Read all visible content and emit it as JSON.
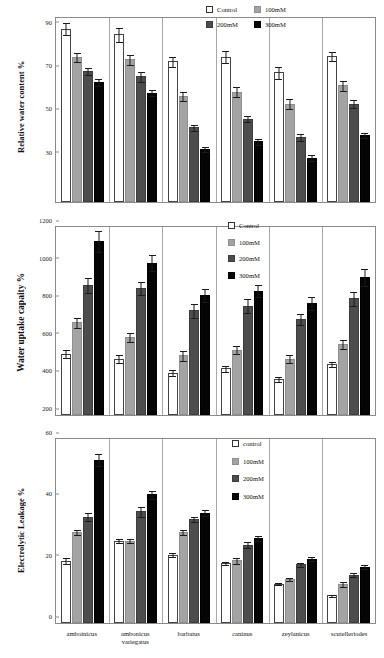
{
  "figure": {
    "categories": [
      "amboinicus",
      "ambonicus variegatus",
      "barbatus",
      "caninus",
      "zeylanicus",
      "scutelleriodes"
    ],
    "series_colors": {
      "control": "#ffffff",
      "100mM": "#a3a3a3",
      "200mM": "#4d4d4d",
      "300mM": "#050505"
    }
  },
  "chart_data": [
    {
      "type": "bar",
      "id": "relative-water-content",
      "title": "",
      "ylabel": "Relative water content  %",
      "xlabel": "",
      "ylim": [
        10,
        95
      ],
      "yticks": [
        30,
        50,
        70,
        90
      ],
      "ytick_labels": [
        "30",
        "50",
        "70",
        "90"
      ],
      "grid": false,
      "legend_position": "top-right",
      "legend": [
        "Control",
        "100mM",
        "200mM",
        "300mM"
      ],
      "categories": [
        "amboinicus",
        "ambonicus variegatus",
        "barbatus",
        "caninus",
        "zeylanicus",
        "scutelleriodes"
      ],
      "series": [
        {
          "name": "Control",
          "values": [
            90.0,
            87.5,
            75.0,
            77.0,
            70.0,
            77.5
          ],
          "errors": [
            3.0,
            3.5,
            2.5,
            3.0,
            3.0,
            2.5
          ]
        },
        {
          "name": "100mM",
          "values": [
            77.0,
            76.0,
            59.0,
            61.0,
            55.5,
            64.0
          ],
          "errors": [
            2.5,
            2.5,
            2.5,
            2.5,
            2.5,
            2.5
          ]
        },
        {
          "name": "200mM",
          "values": [
            70.5,
            68.0,
            44.5,
            48.5,
            40.0,
            55.5
          ],
          "errors": [
            2.0,
            2.5,
            1.5,
            1.5,
            2.0,
            2.0
          ]
        },
        {
          "name": "300mM",
          "values": [
            65.5,
            60.5,
            34.5,
            38.0,
            30.5,
            41.0
          ],
          "errors": [
            2.0,
            1.5,
            1.5,
            1.5,
            1.5,
            1.5
          ]
        }
      ]
    },
    {
      "type": "bar",
      "id": "water-uptake-capacity",
      "title": "",
      "ylabel": "Water uptake capaity %",
      "xlabel": "",
      "ylim": [
        200,
        1200
      ],
      "yticks": [
        200,
        400,
        600,
        800,
        1000,
        1200
      ],
      "ytick_labels": [
        "200",
        "400",
        "600",
        "800",
        "1000",
        "1200"
      ],
      "grid": false,
      "legend_position": "top-right",
      "legend": [
        "Control",
        "100mM",
        "200mM",
        "300mM"
      ],
      "categories": [
        "amboinicus",
        "ambonicus variegatus",
        "barbatus",
        "caninus",
        "zeylanicus",
        "scutelleriodes"
      ],
      "series": [
        {
          "name": "Control",
          "values": [
            527,
            500,
            425,
            448,
            392,
            472
          ],
          "errors": [
            22,
            22,
            20,
            18,
            18,
            18
          ]
        },
        {
          "name": "100mM",
          "values": [
            693,
            615,
            517,
            547,
            500,
            578
          ],
          "errors": [
            30,
            28,
            28,
            25,
            25,
            28
          ]
        },
        {
          "name": "200mM",
          "values": [
            890,
            876,
            757,
            782,
            712,
            820
          ],
          "errors": [
            42,
            35,
            40,
            38,
            32,
            42
          ]
        },
        {
          "name": "300mM",
          "values": [
            1125,
            1010,
            838,
            862,
            795,
            935
          ],
          "errors": [
            58,
            45,
            38,
            35,
            38,
            48
          ]
        }
      ]
    },
    {
      "type": "bar",
      "id": "electrolytic-leakage",
      "title": "",
      "ylabel": "Electrolytic Leakage %",
      "xlabel": "",
      "ylim": [
        0,
        60
      ],
      "yticks": [
        0,
        20,
        40,
        60
      ],
      "ytick_labels": [
        "0",
        "20",
        "40",
        "60"
      ],
      "grid": false,
      "legend_position": "top-right",
      "legend": [
        "control",
        "100mM",
        "200mM",
        "300mM"
      ],
      "categories": [
        "amboinicus",
        "ambonicus variegatus",
        "barbatus",
        "caninus",
        "zeylanicus",
        "scutelleriodes"
      ],
      "series": [
        {
          "name": "control",
          "values": [
            20.3,
            26.8,
            22.2,
            19.6,
            12.8,
            9.0
          ],
          "errors": [
            1.2,
            0.8,
            0.8,
            0.7,
            0.5,
            0.4
          ]
        },
        {
          "name": "100mM",
          "values": [
            29.8,
            26.9,
            29.6,
            20.4,
            14.4,
            12.8
          ],
          "errors": [
            1.0,
            0.8,
            1.0,
            1.2,
            0.7,
            1.0
          ]
        },
        {
          "name": "200mM",
          "values": [
            34.7,
            36.4,
            33.8,
            25.6,
            19.2,
            15.7
          ],
          "errors": [
            1.5,
            1.8,
            1.0,
            1.0,
            0.8,
            0.8
          ]
        },
        {
          "name": "300mM",
          "values": [
            53.3,
            42.0,
            36.0,
            27.6,
            21.0,
            18.3
          ],
          "errors": [
            2.2,
            1.5,
            1.2,
            1.0,
            0.8,
            0.8
          ]
        }
      ]
    }
  ]
}
